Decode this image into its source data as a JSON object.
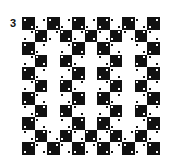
{
  "figure": {
    "label": "3"
  },
  "board": {
    "rows": 11,
    "cols": 11,
    "cell_size_px": 12.5,
    "origin": [
      22,
      17
    ],
    "colors": {
      "dark": "#111111",
      "light": "#ffffff"
    },
    "full_rows": [
      0,
      1,
      9,
      10
    ],
    "blank_columns_in_middle_rows": [
      2,
      5,
      8
    ],
    "center": [
      5,
      5
    ]
  }
}
